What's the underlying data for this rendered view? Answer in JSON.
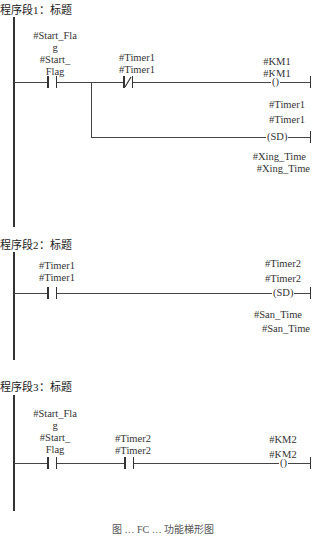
{
  "networks": [
    {
      "title": "程序段1：标题",
      "contacts": [
        {
          "type": "NO",
          "label_lines": [
            "#Start_Fla",
            "g",
            "#Start_",
            "Flag"
          ]
        },
        {
          "type": "NC",
          "label_lines": [
            "#Timer1",
            "#Timer1"
          ]
        }
      ],
      "outputs": [
        {
          "type": "coil",
          "symbol": "()",
          "label_lines": [
            "#KM1",
            "#KM1"
          ]
        },
        {
          "type": "SD",
          "symbol": "(SD)",
          "label_lines": [
            "#Timer1",
            "#Timer1"
          ],
          "param_lines": [
            "#Xing_Time",
            "#Xing_Time"
          ]
        }
      ]
    },
    {
      "title": "程序段2：标题",
      "contacts": [
        {
          "type": "NO",
          "label_lines": [
            "#Timer1",
            "#Timer1"
          ]
        }
      ],
      "outputs": [
        {
          "type": "SD",
          "symbol": "(SD)",
          "label_lines": [
            "#Timer2",
            "#Timer2"
          ],
          "param_lines": [
            "#San_Time",
            "#San_Time"
          ]
        }
      ]
    },
    {
      "title": "程序段3：标题",
      "contacts": [
        {
          "type": "NO",
          "label_lines": [
            "#Start_Fla",
            "g",
            "#Start_",
            "Flag"
          ]
        },
        {
          "type": "NO",
          "label_lines": [
            "#Timer2",
            "#Timer2"
          ]
        }
      ],
      "outputs": [
        {
          "type": "coil",
          "symbol": "()",
          "label_lines": [
            "#KM2",
            "#KM2"
          ]
        }
      ]
    }
  ],
  "caption": "图 … FC … 功能梯形图"
}
